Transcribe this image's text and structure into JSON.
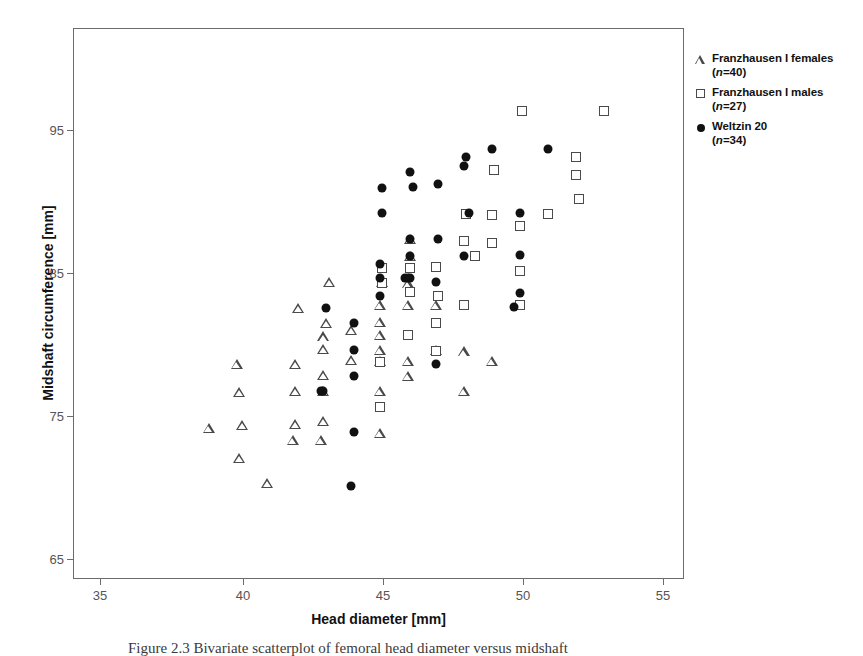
{
  "chart_data": {
    "type": "scatter",
    "title": "",
    "xlabel": "Head diameter [mm]",
    "ylabel": "Midshaft circumference [mm]",
    "xlim": [
      34.1,
      55.9
    ],
    "ylim": [
      63.1,
      103.6
    ],
    "xticks": [
      35,
      40,
      45,
      50,
      55
    ],
    "yticks": [
      65,
      75,
      85,
      95
    ],
    "grid": false,
    "legend_position": "outside-right-top",
    "series": [
      {
        "name": "Franzhausen I  females",
        "n_label": "(n=40)",
        "n": 40,
        "marker": "triangle",
        "points": [
          [
            38.9,
            74.3
          ],
          [
            39.9,
            79.0
          ],
          [
            40.0,
            72.1
          ],
          [
            40.0,
            76.9
          ],
          [
            40.1,
            74.5
          ],
          [
            41.0,
            70.2
          ],
          [
            41.9,
            73.4
          ],
          [
            42.0,
            74.6
          ],
          [
            42.0,
            77.0
          ],
          [
            42.0,
            79.0
          ],
          [
            42.1,
            83.1
          ],
          [
            42.9,
            73.4
          ],
          [
            43.0,
            74.8
          ],
          [
            43.0,
            77.0
          ],
          [
            43.0,
            78.2
          ],
          [
            43.0,
            80.1
          ],
          [
            43.0,
            81.0
          ],
          [
            43.1,
            82.0
          ],
          [
            43.2,
            85.0
          ],
          [
            44.0,
            79.3
          ],
          [
            44.0,
            81.5
          ],
          [
            45.0,
            73.9
          ],
          [
            45.0,
            77.0
          ],
          [
            45.0,
            79.2
          ],
          [
            45.0,
            80.0
          ],
          [
            45.0,
            81.1
          ],
          [
            45.0,
            82.1
          ],
          [
            45.0,
            83.3
          ],
          [
            45.1,
            85.0
          ],
          [
            46.0,
            78.1
          ],
          [
            46.0,
            79.2
          ],
          [
            46.0,
            83.3
          ],
          [
            46.0,
            84.9
          ],
          [
            46.1,
            88.2
          ],
          [
            46.1,
            86.9
          ],
          [
            47.0,
            80.0
          ],
          [
            47.0,
            83.3
          ],
          [
            48.0,
            77.0
          ],
          [
            48.0,
            79.9
          ],
          [
            49.0,
            79.2
          ]
        ]
      },
      {
        "name": "Franzhausen I males",
        "n_label": "(n=27)",
        "n": 27,
        "marker": "square",
        "points": [
          [
            45.0,
            75.8
          ],
          [
            45.0,
            79.1
          ],
          [
            45.1,
            84.9
          ],
          [
            45.1,
            86.0
          ],
          [
            46.0,
            81.1
          ],
          [
            46.1,
            84.3
          ],
          [
            46.1,
            86.0
          ],
          [
            47.0,
            79.9
          ],
          [
            47.0,
            82.0
          ],
          [
            47.0,
            86.1
          ],
          [
            47.1,
            84.0
          ],
          [
            48.0,
            83.3
          ],
          [
            48.0,
            88.0
          ],
          [
            48.1,
            90.0
          ],
          [
            48.4,
            86.9
          ],
          [
            49.0,
            87.9
          ],
          [
            49.0,
            89.9
          ],
          [
            49.1,
            93.2
          ],
          [
            50.0,
            85.8
          ],
          [
            50.0,
            89.1
          ],
          [
            50.1,
            97.6
          ],
          [
            51.0,
            90.0
          ],
          [
            52.0,
            92.9
          ],
          [
            52.0,
            94.2
          ],
          [
            52.1,
            91.1
          ],
          [
            53.0,
            97.6
          ],
          [
            50.0,
            83.3
          ]
        ]
      },
      {
        "name": "Weltzin 20",
        "n_label": "(n=34)",
        "n": 34,
        "marker": "circle",
        "points": [
          [
            42.9,
            77.0
          ],
          [
            43.0,
            77.0
          ],
          [
            43.1,
            83.1
          ],
          [
            44.0,
            70.0
          ],
          [
            44.1,
            74.0
          ],
          [
            44.1,
            78.1
          ],
          [
            44.1,
            80.0
          ],
          [
            44.1,
            82.0
          ],
          [
            45.0,
            84.0
          ],
          [
            45.0,
            85.3
          ],
          [
            45.0,
            86.3
          ],
          [
            45.1,
            90.1
          ],
          [
            45.1,
            91.9
          ],
          [
            45.9,
            85.3
          ],
          [
            46.1,
            85.3
          ],
          [
            46.1,
            86.9
          ],
          [
            46.1,
            88.2
          ],
          [
            46.1,
            93.1
          ],
          [
            46.2,
            92.0
          ],
          [
            47.0,
            79.0
          ],
          [
            47.0,
            85.0
          ],
          [
            47.1,
            88.2
          ],
          [
            47.1,
            92.2
          ],
          [
            48.0,
            86.9
          ],
          [
            48.0,
            93.5
          ],
          [
            48.1,
            94.2
          ],
          [
            48.2,
            90.1
          ],
          [
            49.0,
            94.8
          ],
          [
            49.8,
            83.2
          ],
          [
            50.0,
            84.2
          ],
          [
            50.0,
            87.0
          ],
          [
            50.0,
            90.1
          ],
          [
            51.0,
            94.8
          ],
          [
            46.0,
            85.3
          ]
        ]
      }
    ]
  },
  "axes": {
    "xlabel": "Head diameter [mm]",
    "ylabel": "Midshaft circumference [mm]",
    "xtick_labels": [
      "35",
      "40",
      "45",
      "50",
      "55"
    ],
    "ytick_labels": [
      "95",
      "85",
      "75",
      "65"
    ]
  },
  "legend": {
    "items": [
      {
        "glyph": "triangle",
        "label": "Franzhausen I  females",
        "n": "(n=40)"
      },
      {
        "glyph": "square",
        "label": "Franzhausen I males",
        "n": "(n=27)"
      },
      {
        "glyph": "circle",
        "label": "Weltzin 20",
        "n": "(n=34)"
      }
    ]
  },
  "caption": "Figure 2.3  Bivariate scatterplot of femoral head diameter versus midshaft",
  "colors": {
    "marker_fill": "#111111",
    "marker_outline": "#4a4a4a",
    "frame": "#6b6b6b",
    "text": "#1a1a1a",
    "background": "#ffffff"
  }
}
